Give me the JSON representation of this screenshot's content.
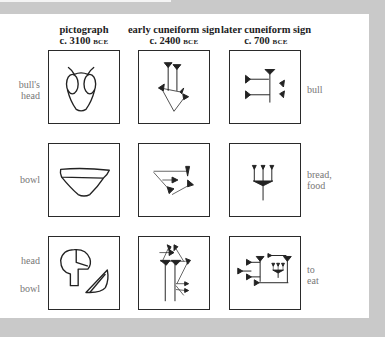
{
  "columns": [
    {
      "title": "pictograph",
      "date": "c. 3100",
      "era": "BCE"
    },
    {
      "title": "early cuneiform sign",
      "date": "c. 2400",
      "era": "BCE"
    },
    {
      "title": "later cuneiform sign",
      "date": "c. 700",
      "era": "BCE"
    }
  ],
  "rows": [
    {
      "left_label_1": "bull's",
      "left_label_2": "head",
      "right_label_1": "bull",
      "right_label_2": ""
    },
    {
      "left_label_1": "bowl",
      "left_label_2": "",
      "right_label_1": "bread,",
      "right_label_2": "food"
    },
    {
      "left_label_1": "head",
      "left_label_2": "bowl",
      "right_label_1": "to",
      "right_label_2": "eat"
    }
  ],
  "icons": {
    "r1c1": "bulls-head-pictograph",
    "r1c2": "bull-early-cuneiform",
    "r1c3": "bull-later-cuneiform",
    "r2c1": "bowl-pictograph",
    "r2c2": "bread-early-cuneiform",
    "r2c3": "bread-later-cuneiform",
    "r3c1": "head-and-bowl-pictograph",
    "r3c2": "eat-early-cuneiform",
    "r3c3": "eat-later-cuneiform"
  },
  "colors": {
    "background": "#c9c9c9",
    "panel": "#ffffff",
    "ink": "#222222",
    "label": "#777777"
  }
}
